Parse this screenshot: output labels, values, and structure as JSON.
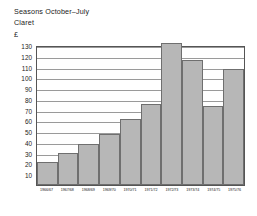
{
  "header": {
    "title_line_1": "Seasons October–July",
    "title_line_2": "Claret"
  },
  "axis": {
    "y_unit": "£",
    "y_ticks": [
      "130",
      "120",
      "110",
      "100",
      "90",
      "80",
      "70",
      "60",
      "50",
      "40",
      "30",
      "20",
      "10"
    ]
  },
  "chart_data": {
    "type": "bar",
    "title": "Seasons October–July",
    "subtitle": "Claret",
    "xlabel": "",
    "ylabel": "£",
    "ylim": [
      0,
      130
    ],
    "grid": true,
    "legend": "none",
    "bar_color": "#b7b7b7",
    "bar_edge_color": "#6f6f6f",
    "categories": [
      "1966/67",
      "1967/68",
      "1968/69",
      "1969/70",
      "1970/71",
      "1971/72",
      "1972/73",
      "1973/74",
      "1974/75",
      "1975/76"
    ],
    "values": [
      21,
      30,
      38,
      47,
      61,
      75,
      132,
      116,
      73,
      108
    ]
  }
}
